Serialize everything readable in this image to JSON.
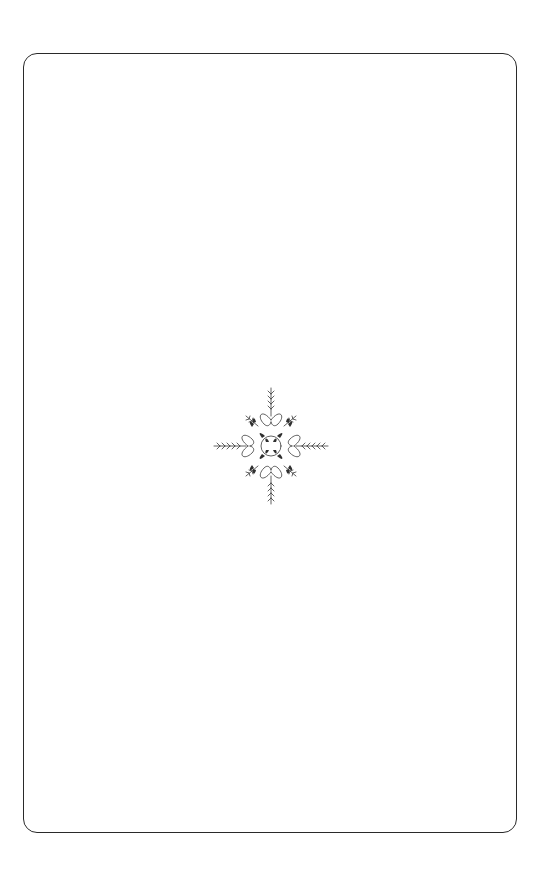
{
  "page": {
    "type": "blank decorative book page",
    "background_color": "#ffffff",
    "border_color": "#2a2a2a",
    "ornament": {
      "icon": "floral-cross-ornament-icon",
      "color": "#3a3a3a",
      "position": "center"
    }
  }
}
